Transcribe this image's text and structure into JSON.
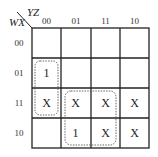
{
  "kmap": {
    "row_var": "WX",
    "col_var": "YZ",
    "col_headers": [
      "00",
      "01",
      "11",
      "10"
    ],
    "row_headers": [
      "00",
      "01",
      "11",
      "10"
    ],
    "cells": [
      [
        "",
        "",
        "",
        ""
      ],
      [
        "1",
        "",
        "",
        ""
      ],
      [
        "X",
        "X",
        "X",
        "X"
      ],
      [
        "",
        "1",
        "X",
        "X"
      ]
    ],
    "groups": [
      {
        "name": "group-col00-rows01-11",
        "cells": [
          [
            1,
            0
          ],
          [
            2,
            0
          ]
        ],
        "style": "dotted"
      },
      {
        "name": "group-cols01-11-rows11-10",
        "cells": [
          [
            2,
            1
          ],
          [
            2,
            2
          ],
          [
            3,
            1
          ],
          [
            3,
            2
          ]
        ],
        "style": "dotted"
      }
    ],
    "line_color": "#222222",
    "group_color": "#555555"
  }
}
